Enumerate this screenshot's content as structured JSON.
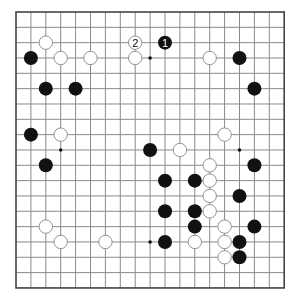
{
  "board": {
    "size": 19,
    "origin_x": 16,
    "origin_y": 12,
    "spacing_x": 14.9,
    "spacing_y": 15.33,
    "stone_radius": 7,
    "colors": {
      "background": "#ffffff",
      "grid": "#8a8a8a",
      "border": "#444444",
      "black_stone": "#111111",
      "white_stone_fill": "#ffffff",
      "white_stone_stroke": "#888888",
      "star_point": "#111111"
    },
    "star_points": [
      [
        9,
        3
      ],
      [
        3,
        9
      ],
      [
        15,
        9
      ],
      [
        9,
        15
      ],
      [
        3,
        3
      ],
      [
        15,
        3
      ],
      [
        9,
        9
      ],
      [
        3,
        15
      ],
      [
        15,
        15
      ]
    ],
    "black_stones": [
      {
        "col": 10,
        "row": 2,
        "label": "1"
      },
      {
        "col": 1,
        "row": 3
      },
      {
        "col": 15,
        "row": 3
      },
      {
        "col": 2,
        "row": 5
      },
      {
        "col": 4,
        "row": 5
      },
      {
        "col": 16,
        "row": 5
      },
      {
        "col": 1,
        "row": 8
      },
      {
        "col": 9,
        "row": 9
      },
      {
        "col": 2,
        "row": 10
      },
      {
        "col": 16,
        "row": 10
      },
      {
        "col": 10,
        "row": 11
      },
      {
        "col": 12,
        "row": 11
      },
      {
        "col": 15,
        "row": 12
      },
      {
        "col": 10,
        "row": 13
      },
      {
        "col": 12,
        "row": 13
      },
      {
        "col": 12,
        "row": 14
      },
      {
        "col": 16,
        "row": 14
      },
      {
        "col": 10,
        "row": 15
      },
      {
        "col": 15,
        "row": 15
      },
      {
        "col": 15,
        "row": 16
      }
    ],
    "white_stones": [
      {
        "col": 2,
        "row": 2
      },
      {
        "col": 8,
        "row": 2,
        "label": "2"
      },
      {
        "col": 3,
        "row": 3
      },
      {
        "col": 5,
        "row": 3
      },
      {
        "col": 8,
        "row": 3
      },
      {
        "col": 13,
        "row": 3
      },
      {
        "col": 3,
        "row": 8
      },
      {
        "col": 14,
        "row": 8
      },
      {
        "col": 11,
        "row": 9
      },
      {
        "col": 13,
        "row": 10
      },
      {
        "col": 13,
        "row": 11
      },
      {
        "col": 13,
        "row": 12
      },
      {
        "col": 13,
        "row": 13
      },
      {
        "col": 2,
        "row": 14
      },
      {
        "col": 14,
        "row": 14
      },
      {
        "col": 3,
        "row": 15
      },
      {
        "col": 6,
        "row": 15
      },
      {
        "col": 12,
        "row": 15
      },
      {
        "col": 14,
        "row": 15
      },
      {
        "col": 14,
        "row": 16
      }
    ]
  }
}
